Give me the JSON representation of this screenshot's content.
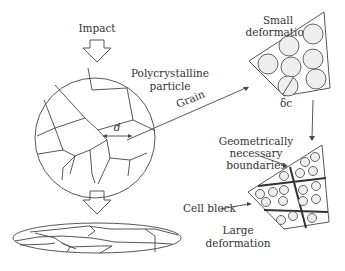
{
  "labels": {
    "impact": "Impact",
    "particle_line1": "Polycrystalline",
    "particle_line2": "particle",
    "grain": "Grain",
    "grain_size": "d",
    "small_def_line1": "Small",
    "small_def_line2": "deformation",
    "cell_size": "δc",
    "gnb_line1": "Geometrically",
    "gnb_line2": "necessary",
    "gnb_line3": "boundaries",
    "cell_block": "Cell block",
    "large_def_line1": "Large",
    "large_def_line2": "deformation"
  },
  "colors": {
    "line": "#444444",
    "cell_fill": "#eeeeee",
    "background": "#ffffff"
  }
}
